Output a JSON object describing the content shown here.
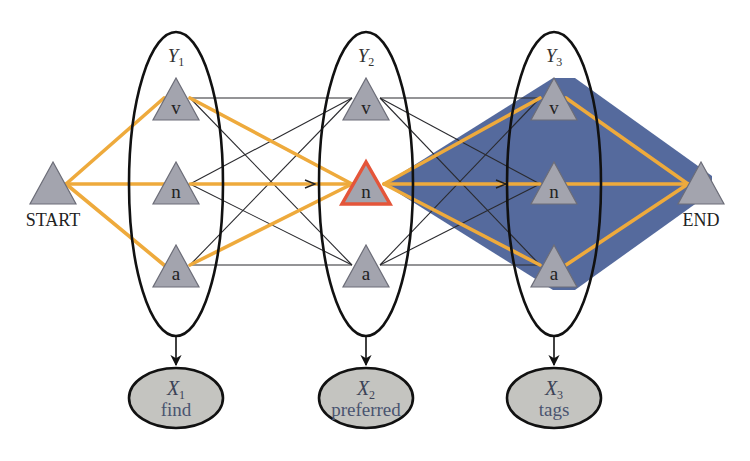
{
  "figure": {
    "type": "viterbi-lattice-diagram",
    "colors": {
      "path_edge": "#eeaa3c",
      "thin_edge": "#2a2a2e",
      "node_fill": "#a3a4ae",
      "node_stroke": "#6c6d78",
      "highlight_stroke": "#e4553a",
      "region_fill": "#4c6298",
      "obs_fill": "#c4c4c0",
      "obs_text": "#4a5470"
    },
    "start": {
      "label": "START"
    },
    "end": {
      "label": "END"
    },
    "columns": [
      {
        "var": "Y",
        "sub": "1",
        "states": [
          "v",
          "n",
          "a"
        ],
        "observation": {
          "var": "X",
          "sub": "1",
          "word": "find"
        }
      },
      {
        "var": "Y",
        "sub": "2",
        "states": [
          "v",
          "n",
          "a"
        ],
        "highlighted_state": "n",
        "observation": {
          "var": "X",
          "sub": "2",
          "word": "preferred"
        }
      },
      {
        "var": "Y",
        "sub": "3",
        "states": [
          "v",
          "n",
          "a"
        ],
        "observation": {
          "var": "X",
          "sub": "3",
          "word": "tags"
        }
      }
    ],
    "highlighted_paths": [
      "START-Y1.v",
      "START-Y1.n",
      "START-Y1.a",
      "Y1.v-Y2.n",
      "Y1.n-Y2.n",
      "Y1.a-Y2.n",
      "Y2.n-Y3.v",
      "Y2.n-Y3.n",
      "Y2.n-Y3.a",
      "Y3.v-END",
      "Y3.n-END",
      "Y3.a-END"
    ],
    "shaded_region": "from Y2.n through Y3 to END"
  }
}
